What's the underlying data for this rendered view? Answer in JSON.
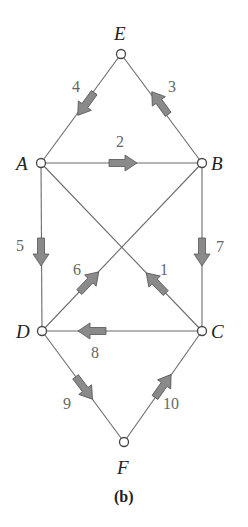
{
  "diagram": {
    "type": "directed-graph",
    "caption": "(b)",
    "colors": {
      "edge": "#6b6b6b",
      "arrow_fill": "#8a8a8a",
      "node_stroke": "#444444",
      "label": "#222222",
      "edge_label": "#666666"
    },
    "nodes": [
      {
        "id": "E",
        "label": "E",
        "x": 121,
        "y": 54
      },
      {
        "id": "A",
        "label": "A",
        "x": 41,
        "y": 163
      },
      {
        "id": "B",
        "label": "B",
        "x": 202,
        "y": 163
      },
      {
        "id": "D",
        "label": "D",
        "x": 42,
        "y": 331
      },
      {
        "id": "C",
        "label": "C",
        "x": 202,
        "y": 331
      },
      {
        "id": "F",
        "label": "F",
        "x": 124,
        "y": 442
      }
    ],
    "edges": [
      {
        "id": "1",
        "label": "1",
        "from": "C",
        "to": "A"
      },
      {
        "id": "2",
        "label": "2",
        "from": "A",
        "to": "B"
      },
      {
        "id": "3",
        "label": "3",
        "from": "B",
        "to": "E"
      },
      {
        "id": "4",
        "label": "4",
        "from": "E",
        "to": "A"
      },
      {
        "id": "5",
        "label": "5",
        "from": "A",
        "to": "D"
      },
      {
        "id": "6",
        "label": "6",
        "from": "D",
        "to": "B"
      },
      {
        "id": "7",
        "label": "7",
        "from": "B",
        "to": "C"
      },
      {
        "id": "8",
        "label": "8",
        "from": "C",
        "to": "D"
      },
      {
        "id": "9",
        "label": "9",
        "from": "D",
        "to": "F"
      },
      {
        "id": "10",
        "label": "10",
        "from": "F",
        "to": "C"
      }
    ]
  }
}
